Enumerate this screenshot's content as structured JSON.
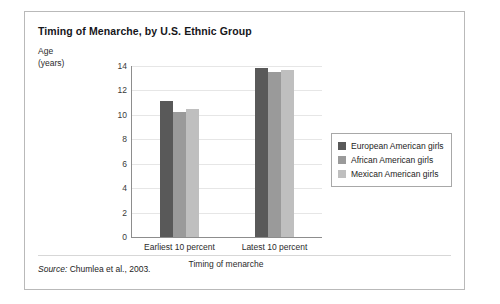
{
  "figure": {
    "title": "Timing of Menarche, by U.S. Ethnic Group",
    "source_label": "Source:",
    "source_text": "Chumlea et al., 2003."
  },
  "chart_data": {
    "type": "bar",
    "title": "Timing of Menarche, by U.S. Ethnic Group",
    "xlabel": "Timing of menarche",
    "ylabel": "Age (years)",
    "ylabel_line1": "Age",
    "ylabel_line2": "(years)",
    "categories": [
      "Earliest 10 percent",
      "Latest 10 percent"
    ],
    "series": [
      {
        "name": "European American girls",
        "color": "#595959",
        "values": [
          11.1,
          13.85
        ]
      },
      {
        "name": "African American girls",
        "color": "#9a9a9a",
        "values": [
          10.2,
          13.55
        ]
      },
      {
        "name": "Mexican American girls",
        "color": "#bfbfbf",
        "values": [
          10.45,
          13.7
        ]
      }
    ],
    "ylim": [
      0,
      14
    ],
    "yticks": [
      0,
      2,
      4,
      6,
      8,
      10,
      12,
      14
    ],
    "grid": true,
    "legend_position": "right"
  }
}
